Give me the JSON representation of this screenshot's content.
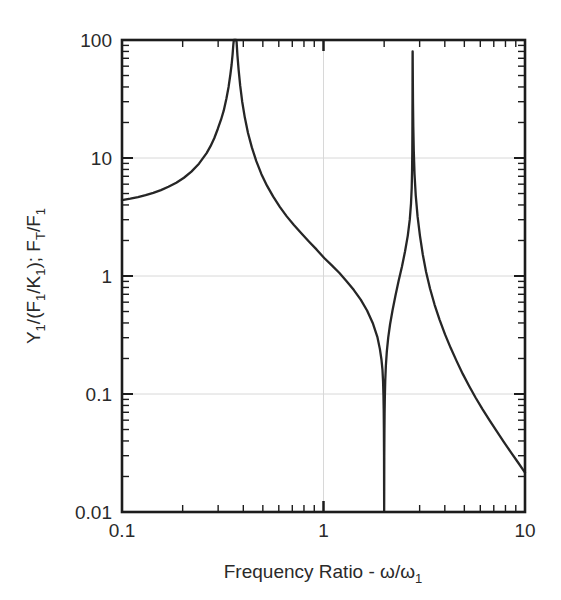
{
  "chart_data": {
    "type": "line",
    "title": "",
    "xlabel": "Frequency Ratio - ω/ω₁",
    "ylabel": "Y₁/(F₁/K₁); Fₜ/F₁",
    "xscale": "log",
    "yscale": "log",
    "xlim": [
      0.1,
      10
    ],
    "ylim": [
      0.01,
      100
    ],
    "grid": true,
    "legend": null,
    "x_major_ticks": [
      0.1,
      1,
      10
    ],
    "x_major_tick_labels": [
      "0.1",
      "1",
      "10"
    ],
    "y_major_ticks": [
      0.01,
      0.1,
      1,
      10,
      100
    ],
    "y_major_tick_labels": [
      "0.01",
      "0.1",
      "1",
      "10",
      "100"
    ],
    "features": {
      "value_at_x_min": 4.4,
      "first_resonance_x": 0.363,
      "antiresonance_x": 2.0,
      "second_resonance_x": 2.76,
      "second_peak_clipped_value": 80,
      "value_at_x_max": 0.012
    },
    "series": [
      {
        "name": "response",
        "points_x": [
          0.1,
          0.11,
          0.12,
          0.131,
          0.143,
          0.156,
          0.17,
          0.186,
          0.203,
          0.221,
          0.241,
          0.263,
          0.275,
          0.287,
          0.299,
          0.31,
          0.32,
          0.33,
          0.338,
          0.345,
          0.35,
          0.354,
          0.357,
          0.359,
          0.3605,
          0.3615,
          0.3622,
          0.3628,
          0.3632,
          0.3636,
          0.364,
          0.3644,
          0.3648,
          0.3654,
          0.3662,
          0.3672,
          0.3685,
          0.3705,
          0.374,
          0.379,
          0.386,
          0.395,
          0.407,
          0.422,
          0.441,
          0.464,
          0.492,
          0.525,
          0.563,
          0.607,
          0.657,
          0.713,
          0.776,
          0.846,
          0.923,
          1.008,
          1.1,
          1.2,
          1.305,
          1.415,
          1.53,
          1.645,
          1.755,
          1.85,
          1.905,
          1.94,
          1.962,
          1.975,
          1.984,
          1.99,
          1.994,
          1.997,
          1.9988,
          2.0,
          2.0012,
          2.003,
          2.006,
          2.01,
          2.016,
          2.025,
          2.04,
          2.062,
          2.095,
          2.14,
          2.2,
          2.275,
          2.36,
          2.45,
          2.54,
          2.62,
          2.68,
          2.718,
          2.74,
          2.752,
          2.758,
          2.7615,
          2.7635,
          2.7648,
          2.7658,
          2.7668,
          2.7682,
          2.77,
          2.7725,
          2.776,
          2.781,
          2.79,
          2.805,
          2.83,
          2.87,
          2.93,
          3.01,
          3.11,
          3.23,
          3.38,
          3.56,
          3.77,
          4.01,
          4.28,
          4.58,
          4.91,
          5.28,
          5.69,
          6.15,
          6.66,
          7.22,
          7.83,
          8.5,
          9.22,
          10.0
        ],
        "points_y": [
          4.4,
          4.52,
          4.66,
          4.84,
          5.06,
          5.34,
          5.7,
          6.17,
          6.8,
          7.67,
          8.95,
          11.0,
          12.6,
          14.7,
          17.7,
          21.1,
          25.3,
          32.1,
          40.0,
          51.0,
          62.0,
          76.0,
          92.0,
          100.0,
          100.0,
          100.0,
          100.0,
          100.0,
          100.0,
          100.0,
          100.0,
          100.0,
          100.0,
          100.0,
          100.0,
          100.0,
          100.0,
          96.0,
          74.0,
          56.0,
          41.0,
          30.0,
          22.0,
          16.3,
          12.3,
          9.4,
          7.3,
          5.8,
          4.7,
          3.85,
          3.2,
          2.7,
          2.3,
          1.96,
          1.68,
          1.42,
          1.23,
          1.06,
          0.9,
          0.76,
          0.63,
          0.51,
          0.4,
          0.305,
          0.24,
          0.195,
          0.16,
          0.128,
          0.098,
          0.072,
          0.05,
          0.03,
          0.0145,
          0.0102,
          0.015,
          0.029,
          0.047,
          0.068,
          0.095,
          0.129,
          0.175,
          0.23,
          0.3,
          0.39,
          0.51,
          0.68,
          0.91,
          1.2,
          1.62,
          2.2,
          3.0,
          4.1,
          5.6,
          7.9,
          11.2,
          16.0,
          23.0,
          32.0,
          45.0,
          62.0,
          80.0,
          80.0,
          62.0,
          44.0,
          29.0,
          18.5,
          11.6,
          7.3,
          4.8,
          3.2,
          2.2,
          1.52,
          1.08,
          0.78,
          0.57,
          0.425,
          0.32,
          0.245,
          0.19,
          0.148,
          0.117,
          0.093,
          0.0745,
          0.06,
          0.0486,
          0.0395,
          0.0322,
          0.0264,
          0.0216,
          0.0178,
          0.0146,
          0.012
        ]
      }
    ]
  },
  "axes": {
    "y_labels": [
      "100",
      "10",
      "1",
      "0.1",
      "0.01"
    ],
    "x_labels": [
      "0.1",
      "1",
      "10"
    ],
    "y_title_parts": {
      "p1": "Y",
      "s1": "1",
      "p2": "/(F",
      "s2": "1",
      "p3": "/K",
      "s3": "1",
      "p4": "); F",
      "s4": "T",
      "p5": "/F",
      "s5": "1"
    },
    "x_title_parts": {
      "p1": "Frequency Ratio - ω/ω",
      "s1": "1"
    }
  },
  "colors": {
    "curve": "#262626",
    "frame": "#1c1c1c",
    "grid": "#d8d8d8",
    "background": "#ffffff",
    "text": "#2a2a2a"
  }
}
